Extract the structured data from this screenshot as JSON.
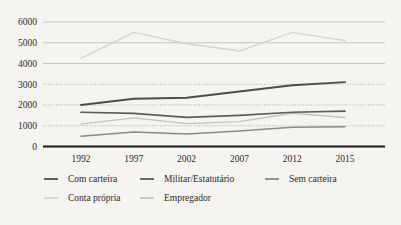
{
  "chart_data": {
    "type": "line",
    "title": "",
    "subtitle": "",
    "xlabel": "",
    "ylabel": "",
    "categories": [
      "1992",
      "1997",
      "2002",
      "2007",
      "2012",
      "2015"
    ],
    "x": [
      1992,
      1997,
      2002,
      2007,
      2012,
      2015
    ],
    "ylim": [
      0,
      6000
    ],
    "xlim": [
      1990,
      2017
    ],
    "yticks": [
      0,
      1000,
      2000,
      3000,
      4000,
      5000,
      6000
    ],
    "ytick_labels": [
      "0",
      "1000",
      "2000",
      "3000",
      "4000",
      "5000",
      "6000"
    ],
    "xtick_labels": [
      "1992",
      "1997",
      "2002",
      "2007",
      "2012",
      "2015"
    ],
    "grid": true,
    "grid_style": {
      "solid_levels": [
        4000,
        5000,
        6000
      ],
      "dotted_levels": [
        1000,
        2000,
        3000
      ],
      "solid_color": "#b9b9b9",
      "dotted_color": "#9a9a9a"
    },
    "legend_position": "below",
    "legend_rows": 2,
    "background_color": "#f6f4f0",
    "axis_color": "#1a1a1a",
    "series": [
      {
        "name": "Com carteira",
        "color": "#4d4d4d",
        "width": 1.9,
        "values": [
          2000,
          2300,
          2350,
          2650,
          2950,
          3100
        ]
      },
      {
        "name": "Militar/Estatutário",
        "color": "#5c5c5c",
        "width": 1.7,
        "values": [
          1650,
          1600,
          1400,
          1500,
          1650,
          1700
        ]
      },
      {
        "name": "Sem carteira",
        "color": "#8a8a8a",
        "width": 1.5,
        "values": [
          500,
          700,
          600,
          750,
          930,
          950
        ]
      },
      {
        "name": "Conta própria",
        "color": "#d3d3d3",
        "width": 1.4,
        "values": [
          4250,
          5500,
          4950,
          4600,
          5500,
          5100
        ]
      },
      {
        "name": "Empregador",
        "color": "#c2c2c2",
        "width": 1.4,
        "values": [
          1080,
          1380,
          1100,
          1200,
          1600,
          1400
        ]
      }
    ]
  },
  "legend": {
    "entries": [
      {
        "label": "Com carteira",
        "color": "#4d4d4d"
      },
      {
        "label": "Militar/Estatutário",
        "color": "#5c5c5c"
      },
      {
        "label": "Sem carteira",
        "color": "#8a8a8a"
      },
      {
        "label": "Conta própria",
        "color": "#d3d3d3"
      },
      {
        "label": "Empregador",
        "color": "#c2c2c2"
      }
    ]
  }
}
